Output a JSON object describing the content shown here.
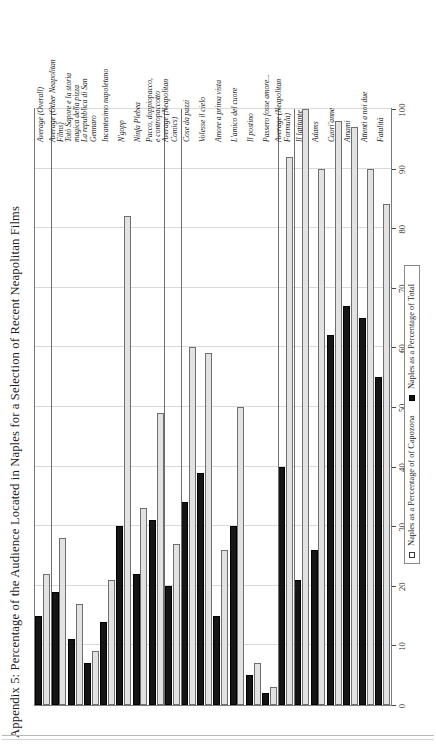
{
  "title": "Appendix 5: Percentage of the Audience Located in Naples for a Selection of Recent Neapolitan Films",
  "legend": {
    "item_light": "Naples as a Percentage of of Capozona",
    "item_dark": "Naples as a Percentage of Total"
  },
  "axis": {
    "ticks": [
      "0",
      "10",
      "20",
      "30",
      "40",
      "50",
      "60",
      "70",
      "80",
      "90",
      "100"
    ],
    "min": 0,
    "max": 100
  },
  "chart_data": {
    "type": "bar",
    "orientation": "horizontal",
    "title": "Appendix 5: Percentage of the Audience Located in Naples for a Selection of Recent Neapolitan Films",
    "xlabel": "",
    "ylabel": "",
    "xlim": [
      0,
      100
    ],
    "grid": true,
    "legend_position": "bottom",
    "categories": [
      "Fatalità",
      "Attenti a noi due",
      "Amami",
      "Cuori'anne",
      "Adams",
      "Il latitante",
      "Average (Neapolitan\nFormula)",
      "Passero fosse amore...",
      "Il postino",
      "L'amico del cuore",
      "Amore a prima vista",
      "Volesse il cielo",
      "Cose da pazzi",
      "Average (Neapolitan\nComics)",
      "Pacco, doppiopacco,\ne contropaccotto",
      "Ninfa Plebea",
      "N'gopp",
      "Incantesimo napoletano",
      "La repubblica di San\nGennaro",
      "Totò Sapore e la storia\nmagica della pizza",
      "Average (Other Neapolitan\nFilms)",
      "Average (Overall)"
    ],
    "series": [
      {
        "name": "Naples as a Percentage of of Capozona",
        "color": "#e2e2e2",
        "values": [
          84,
          90,
          97,
          98,
          90,
          100,
          92,
          3,
          7,
          50,
          26,
          59,
          60,
          27,
          49,
          33,
          82,
          21,
          9,
          17,
          28,
          22
        ]
      },
      {
        "name": "Naples as a Percentage of Total",
        "color": "#151515",
        "values": [
          55,
          65,
          67,
          62,
          26,
          21,
          40,
          2,
          5,
          30,
          15,
          39,
          34,
          20,
          31,
          22,
          30,
          14,
          7,
          11,
          19,
          15
        ]
      }
    ],
    "group_separators_after": [
      "Il latitante",
      "Average (Neapolitan\nFormula)",
      "Cose da pazzi",
      "Average (Neapolitan\nComics)",
      "Average (Other Neapolitan\nFilms)"
    ]
  }
}
